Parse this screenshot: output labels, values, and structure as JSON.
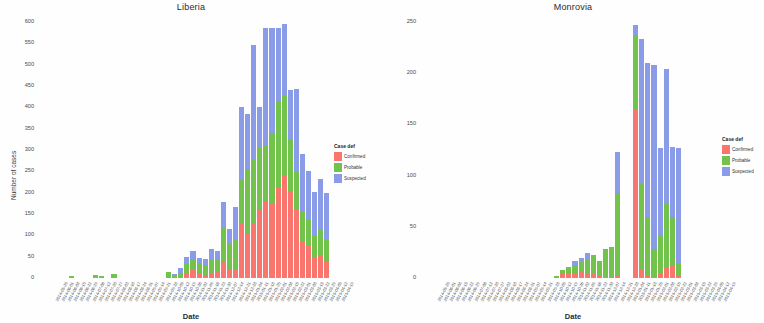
{
  "figure": {
    "background_color": "#ffffff",
    "panels": [
      {
        "title": "Liberia",
        "xlabel": "Date",
        "ylabel": "Number of cases"
      },
      {
        "title": "Monrovia",
        "xlabel": "Date",
        "ylabel": "Number of cases"
      }
    ]
  },
  "legend": {
    "title": "Case def",
    "entries": [
      {
        "label": "Confirmed",
        "color": "#F8766D"
      },
      {
        "label": "Probable",
        "color": "#72C34B"
      },
      {
        "label": "Suspected",
        "color": "#8A9BE8"
      }
    ]
  },
  "chart_data": [
    {
      "type": "bar",
      "stacked": true,
      "title": "Liberia",
      "xlabel": "Date",
      "ylabel": "Number of cases",
      "ylim": [
        0,
        600
      ],
      "yticks": [
        0,
        50,
        100,
        150,
        200,
        250,
        300,
        350,
        400,
        450,
        500,
        550,
        600
      ],
      "ytick_labels": [
        "0",
        "50",
        "100",
        "150",
        "200",
        "250",
        "300",
        "350",
        "400",
        "450",
        "500",
        "550",
        "600"
      ],
      "grid": false,
      "legend_position": "right",
      "categories": [
        "2014-05-25",
        "2014-06-01",
        "2014-06-08",
        "2014-06-15",
        "2014-06-22",
        "2014-06-29",
        "2014-07-06",
        "2014-07-13",
        "2014-07-20",
        "2014-07-27",
        "2014-08-03",
        "2014-08-10",
        "2014-08-17",
        "2014-08-24",
        "2014-08-31",
        "2014-09-07",
        "2014-09-14",
        "2014-09-21",
        "2014-09-28",
        "2014-10-05",
        "2014-10-12",
        "2014-10-19",
        "2014-10-26",
        "2014-11-02",
        "2014-11-09",
        "2014-11-16",
        "2014-11-23",
        "2014-11-30",
        "2014-12-07",
        "2014-12-14",
        "2014-12-21",
        "2014-12-28",
        "2015-01-04",
        "2015-01-11",
        "2015-01-18",
        "2015-01-25",
        "2015-02-01",
        "2015-02-08",
        "2015-02-15",
        "2015-02-22",
        "2015-03-01",
        "2015-03-08",
        "2015-03-15",
        "2015-03-22",
        "2015-03-29",
        "2015-04-05",
        "2015-04-12",
        "2015-04-19"
      ],
      "series": [
        {
          "name": "Confirmed",
          "color": "#F8766D",
          "values": [
            0,
            0,
            0,
            0,
            0,
            0,
            0,
            0,
            0,
            0,
            0,
            0,
            2,
            0,
            0,
            0,
            0,
            0,
            0,
            0,
            0,
            2,
            0,
            0,
            12,
            18,
            12,
            8,
            10,
            14,
            40,
            22,
            20,
            130,
            105,
            130,
            160,
            180,
            175,
            210,
            240,
            205,
            160,
            85,
            75,
            50,
            52,
            40
          ]
        },
        {
          "name": "Probable",
          "color": "#72C34B",
          "values": [
            0,
            0,
            0,
            0,
            0,
            4,
            0,
            0,
            0,
            6,
            5,
            0,
            8,
            0,
            0,
            0,
            0,
            0,
            0,
            0,
            0,
            12,
            6,
            12,
            20,
            26,
            22,
            22,
            32,
            30,
            78,
            58,
            72,
            100,
            150,
            150,
            145,
            130,
            165,
            205,
            190,
            118,
            88,
            70,
            60,
            52,
            60,
            50
          ]
        },
        {
          "name": "Suspected",
          "color": "#8A9BE8",
          "values": [
            0,
            0,
            0,
            0,
            0,
            0,
            0,
            0,
            0,
            0,
            0,
            0,
            0,
            0,
            0,
            0,
            0,
            0,
            0,
            0,
            0,
            0,
            4,
            12,
            18,
            20,
            12,
            14,
            26,
            20,
            60,
            35,
            75,
            170,
            130,
            265,
            95,
            275,
            245,
            170,
            165,
            118,
            195,
            135,
            115,
            100,
            120,
            110
          ]
        }
      ]
    },
    {
      "type": "bar",
      "stacked": true,
      "title": "Monrovia",
      "xlabel": "Date",
      "ylabel": "Number of cases",
      "ylim": [
        0,
        250
      ],
      "yticks": [
        0,
        50,
        100,
        150,
        200,
        250
      ],
      "ytick_labels": [
        "0",
        "50",
        "100",
        "150",
        "200",
        "250"
      ],
      "grid": false,
      "legend_position": "right",
      "categories": [
        "2014-05-25",
        "2014-06-01",
        "2014-06-08",
        "2014-06-15",
        "2014-06-22",
        "2014-06-29",
        "2014-07-06",
        "2014-07-13",
        "2014-07-20",
        "2014-07-27",
        "2014-08-03",
        "2014-08-10",
        "2014-08-17",
        "2014-08-24",
        "2014-08-31",
        "2014-09-07",
        "2014-09-14",
        "2014-09-21",
        "2014-09-28",
        "2014-10-05",
        "2014-10-12",
        "2014-10-19",
        "2014-10-26",
        "2014-11-02",
        "2014-11-09",
        "2014-11-16",
        "2014-11-23",
        "2014-11-30",
        "2014-12-07",
        "2014-12-14",
        "2014-12-21",
        "2014-12-28",
        "2015-01-04",
        "2015-01-11",
        "2015-01-18",
        "2015-01-25",
        "2015-02-01",
        "2015-02-08",
        "2015-02-15",
        "2015-02-22",
        "2015-03-01",
        "2015-03-08",
        "2015-03-15",
        "2015-03-22",
        "2015-03-29",
        "2015-04-05",
        "2015-04-12",
        "2015-04-19"
      ],
      "series": [
        {
          "name": "Confirmed",
          "color": "#F8766D",
          "values": [
            0,
            0,
            0,
            0,
            0,
            0,
            0,
            0,
            0,
            0,
            0,
            0,
            0,
            0,
            0,
            0,
            0,
            0,
            0,
            0,
            0,
            0,
            0,
            4,
            5,
            5,
            6,
            5,
            4,
            3,
            0,
            0,
            3,
            0,
            0,
            165,
            8,
            2,
            0,
            4,
            10,
            12,
            3,
            0,
            0,
            0,
            0,
            0
          ]
        },
        {
          "name": "Probable",
          "color": "#72C34B",
          "values": [
            0,
            0,
            0,
            0,
            0,
            0,
            0,
            0,
            0,
            0,
            0,
            0,
            0,
            0,
            0,
            0,
            0,
            0,
            0,
            0,
            0,
            0,
            2,
            4,
            6,
            8,
            10,
            14,
            18,
            14,
            28,
            30,
            80,
            0,
            0,
            72,
            85,
            58,
            28,
            38,
            62,
            48,
            12,
            0,
            0,
            0,
            0,
            0
          ]
        },
        {
          "name": "Suspected",
          "color": "#8A9BE8",
          "values": [
            0,
            0,
            0,
            0,
            0,
            0,
            0,
            0,
            0,
            0,
            0,
            0,
            0,
            0,
            0,
            0,
            0,
            0,
            0,
            0,
            0,
            0,
            0,
            0,
            0,
            4,
            4,
            5,
            0,
            0,
            0,
            0,
            40,
            0,
            0,
            10,
            140,
            150,
            180,
            85,
            132,
            68,
            112,
            0,
            0,
            0,
            0,
            0
          ]
        }
      ]
    }
  ]
}
